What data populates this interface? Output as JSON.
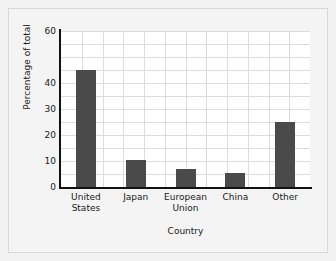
{
  "chart_data": {
    "type": "bar",
    "title": "",
    "xlabel": "Country",
    "ylabel": "Percentage of total",
    "categories": [
      "United States",
      "Japan",
      "European Union",
      "China",
      "Other"
    ],
    "category_lines": [
      [
        "United",
        "States"
      ],
      [
        "Japan",
        ""
      ],
      [
        "European",
        "Union"
      ],
      [
        "China",
        ""
      ],
      [
        "Other",
        ""
      ]
    ],
    "values": [
      45,
      10.5,
      7,
      5.5,
      25
    ],
    "ylim": [
      0,
      60
    ],
    "xlim_note": "categorical, 5 evenly spaced bars",
    "ytick_values": [
      0,
      10,
      20,
      30,
      40,
      60
    ],
    "ytick_labels": [
      "0",
      "10",
      "20",
      "30",
      "40",
      "60"
    ],
    "ytick_minor_step": 5,
    "grid": true,
    "grid_axes": "both",
    "legend": "none",
    "bar_color": "#4a4a4a",
    "grid_color": "#dcdcdc",
    "axis_color": "#111111",
    "plot_background": "#ffffff",
    "figure_background": "#f2f2f2"
  }
}
